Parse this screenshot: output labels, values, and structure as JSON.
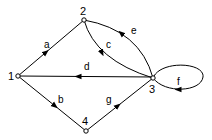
{
  "diagram": {
    "type": "directed-graph",
    "nodes": [
      {
        "id": "1",
        "label": "1"
      },
      {
        "id": "2",
        "label": "2"
      },
      {
        "id": "3",
        "label": "3"
      },
      {
        "id": "4",
        "label": "4"
      }
    ],
    "edges": [
      {
        "id": "a",
        "label": "a",
        "from": "1",
        "to": "2",
        "shape": "straight"
      },
      {
        "id": "b",
        "label": "b",
        "from": "1",
        "to": "4",
        "shape": "straight"
      },
      {
        "id": "c",
        "label": "c",
        "from": "2",
        "to": "3",
        "shape": "curved"
      },
      {
        "id": "d",
        "label": "d",
        "from": "3",
        "to": "1",
        "shape": "straight"
      },
      {
        "id": "e",
        "label": "e",
        "from": "3",
        "to": "2",
        "shape": "curved"
      },
      {
        "id": "f",
        "label": "f",
        "from": "3",
        "to": "3",
        "shape": "self-loop"
      },
      {
        "id": "g",
        "label": "g",
        "from": "4",
        "to": "3",
        "shape": "straight"
      }
    ],
    "colors": {
      "stroke": "#000000",
      "background": "#ffffff"
    }
  }
}
